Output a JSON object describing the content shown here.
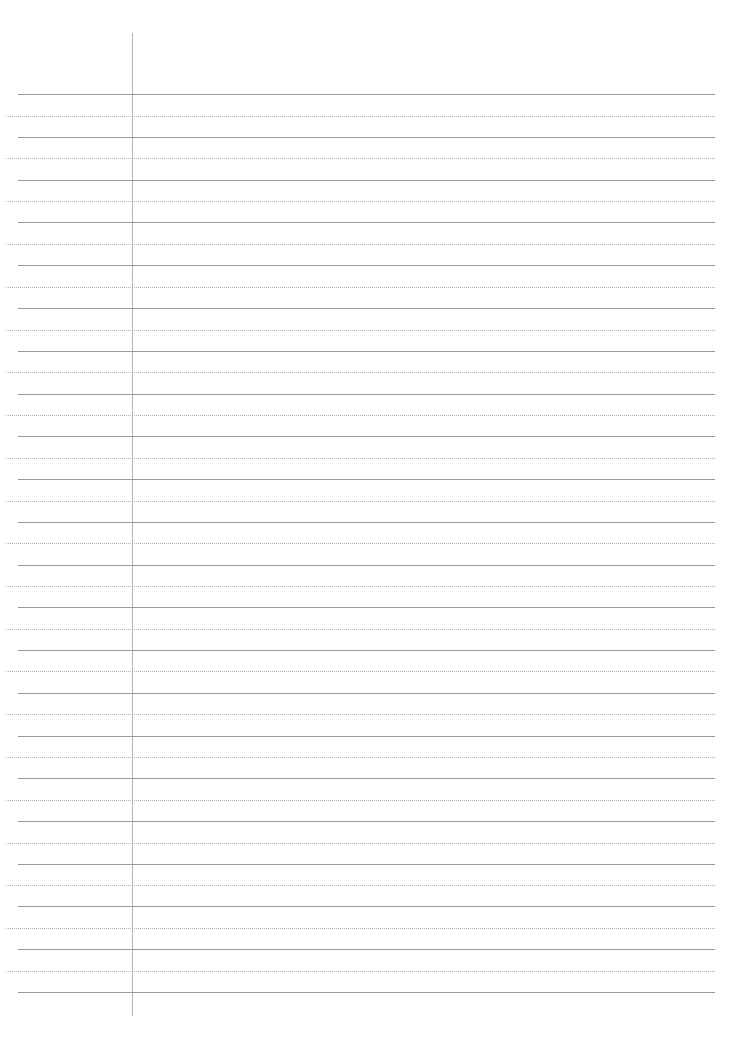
{
  "page": {
    "type": "lined-paper",
    "background": "#ffffff",
    "line_color": "#9a9a9a",
    "dot_color": "#b0b0b0",
    "margin_color": "#b5b5b5",
    "margin_x": 132,
    "solid_lines_y": [
      94,
      137,
      180,
      222,
      265,
      308,
      351,
      394,
      436,
      479,
      522,
      565,
      607,
      650,
      693,
      736,
      778,
      821,
      864,
      906,
      949,
      992
    ],
    "dotted_lines_y": [
      116,
      158,
      201,
      244,
      287,
      330,
      372,
      415,
      458,
      501,
      543,
      586,
      629,
      671,
      714,
      757,
      800,
      843,
      885,
      928,
      971
    ]
  }
}
